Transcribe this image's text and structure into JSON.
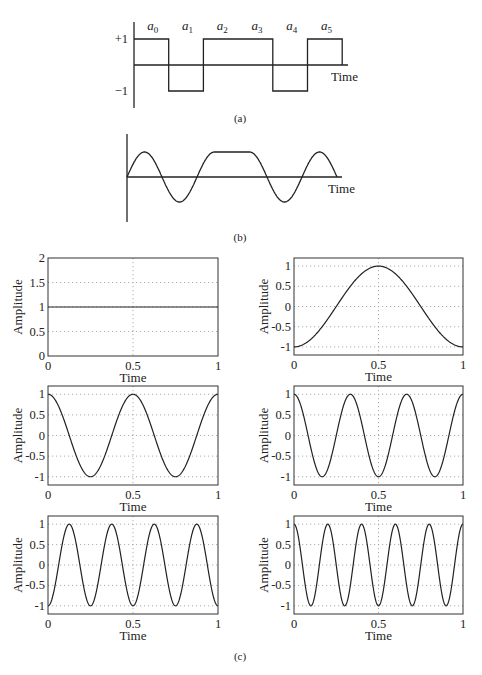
{
  "panels": {
    "a": {
      "caption": "(a)",
      "x_axis_label": "Time",
      "y_ticks": [
        "+1",
        "−1"
      ],
      "symbols": [
        "a",
        "a",
        "a",
        "a",
        "a",
        "a"
      ],
      "symbol_subscripts": [
        "0",
        "1",
        "2",
        "3",
        "4",
        "5"
      ]
    },
    "b": {
      "caption": "(b)",
      "x_axis_label": "Time"
    },
    "c": {
      "caption": "(c)"
    }
  },
  "chart_data": [
    {
      "id": "a",
      "type": "line",
      "title": "",
      "description": "Binary rectangular (NRZ) pulse train",
      "xlabel": "Time",
      "ylabel": "",
      "symbols": [
        "a0",
        "a1",
        "a2",
        "a3",
        "a4",
        "a5"
      ],
      "values": [
        1,
        -1,
        1,
        1,
        -1,
        1
      ],
      "yticks": [
        "+1",
        "-1"
      ]
    },
    {
      "id": "b",
      "type": "line",
      "title": "",
      "description": "Smoothed (raised-cosine-shaped) version of the same symbol sequence",
      "xlabel": "Time",
      "ylabel": "",
      "values": [
        1,
        -1,
        1,
        1,
        -1,
        1
      ]
    },
    {
      "id": "c1",
      "type": "line",
      "xlabel": "Time",
      "ylabel": "Amplitude",
      "function": "1",
      "xlim": [
        0,
        1
      ],
      "ylim": [
        0,
        2
      ],
      "xticks": [
        "0",
        "0.5",
        "1"
      ],
      "yticks": [
        "0",
        "0.5",
        "1",
        "1.5",
        "2"
      ],
      "x": [
        0,
        0.25,
        0.5,
        0.75,
        1
      ],
      "y": [
        1,
        1,
        1,
        1,
        1
      ],
      "grid": true
    },
    {
      "id": "c2",
      "type": "line",
      "xlabel": "Time",
      "ylabel": "Amplitude",
      "function": "-cos(2*pi*t)",
      "xlim": [
        0,
        1
      ],
      "ylim": [
        -1.2,
        1.2
      ],
      "xticks": [
        "0",
        "0.5",
        "1"
      ],
      "yticks": [
        "-1",
        "-0.5",
        "0",
        "0.5",
        "1"
      ],
      "x": [
        0,
        0.25,
        0.5,
        0.75,
        1
      ],
      "y": [
        -1,
        0,
        1,
        0,
        -1
      ],
      "grid": true
    },
    {
      "id": "c3",
      "type": "line",
      "xlabel": "Time",
      "ylabel": "Amplitude",
      "function": "cos(4*pi*t)",
      "xlim": [
        0,
        1
      ],
      "ylim": [
        -1.2,
        1.2
      ],
      "xticks": [
        "0",
        "0.5",
        "1"
      ],
      "yticks": [
        "-1",
        "-0.5",
        "0",
        "0.5",
        "1"
      ],
      "x": [
        0,
        0.25,
        0.5,
        0.75,
        1
      ],
      "y": [
        1,
        -1,
        1,
        -1,
        1
      ],
      "grid": true
    },
    {
      "id": "c4",
      "type": "line",
      "xlabel": "Time",
      "ylabel": "Amplitude",
      "function": "cos(6*pi*t)",
      "xlim": [
        0,
        1
      ],
      "ylim": [
        -1.2,
        1.2
      ],
      "xticks": [
        "0",
        "0.5",
        "1"
      ],
      "yticks": [
        "-1",
        "-0.5",
        "0",
        "0.5",
        "1"
      ],
      "x": [
        0,
        0.1667,
        0.3333,
        0.5,
        0.6667,
        0.8333,
        1
      ],
      "y": [
        1,
        -1,
        1,
        -1,
        1,
        -1,
        1
      ],
      "grid": true
    },
    {
      "id": "c5",
      "type": "line",
      "xlabel": "Time",
      "ylabel": "Amplitude",
      "function": "-cos(8*pi*t)",
      "xlim": [
        0,
        1
      ],
      "ylim": [
        -1.2,
        1.2
      ],
      "xticks": [
        "0",
        "0.5",
        "1"
      ],
      "yticks": [
        "-1",
        "-0.5",
        "0",
        "0.5",
        "1"
      ],
      "x": [
        0,
        0.125,
        0.25,
        0.375,
        0.5,
        0.625,
        0.75,
        0.875,
        1
      ],
      "y": [
        -1,
        1,
        -1,
        1,
        -1,
        1,
        -1,
        1,
        -1
      ],
      "grid": true
    },
    {
      "id": "c6",
      "type": "line",
      "xlabel": "Time",
      "ylabel": "Amplitude",
      "function": "cos(10*pi*t)",
      "xlim": [
        0,
        1
      ],
      "ylim": [
        -1.2,
        1.2
      ],
      "xticks": [
        "0",
        "0.5",
        "1"
      ],
      "yticks": [
        "-1",
        "-0.5",
        "0",
        "0.5",
        "1"
      ],
      "x": [
        0,
        0.1,
        0.2,
        0.3,
        0.4,
        0.5,
        0.6,
        0.7,
        0.8,
        0.9,
        1
      ],
      "y": [
        1,
        -1,
        1,
        -1,
        1,
        -1,
        1,
        -1,
        1,
        -1,
        1
      ],
      "grid": true
    }
  ]
}
